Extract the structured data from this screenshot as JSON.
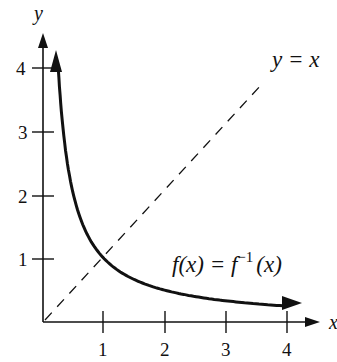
{
  "chart_data": {
    "type": "line",
    "title": "",
    "xlabel": "x",
    "ylabel": "y",
    "xlim": [
      0,
      4.5
    ],
    "ylim": [
      0,
      4.5
    ],
    "grid": false,
    "x_ticks": [
      "1",
      "2",
      "3",
      "4"
    ],
    "y_ticks": [
      "1",
      "2",
      "3",
      "4"
    ],
    "series": [
      {
        "name": "f(x) = f^-1(x)",
        "function": "y = 1/x",
        "style": "solid-thick-arrowheads",
        "x": [
          0.25,
          0.3,
          0.4,
          0.5,
          0.75,
          1,
          1.5,
          2,
          2.5,
          3,
          3.5,
          4
        ],
        "y": [
          4,
          3.33,
          2.5,
          2,
          1.33,
          1,
          0.67,
          0.5,
          0.4,
          0.33,
          0.29,
          0.25
        ]
      },
      {
        "name": "y = x",
        "function": "y = x",
        "style": "dashed",
        "x": [
          0,
          4
        ],
        "y": [
          0,
          4
        ]
      }
    ],
    "annotations": [
      {
        "text": "y = x",
        "x": 3.9,
        "y": 4.2
      },
      {
        "text": "f(x) = f^-1(x)",
        "x": 2.6,
        "y": 0.9
      }
    ]
  },
  "labels": {
    "x_axis": "x",
    "y_axis": "y",
    "x_ticks": [
      "1",
      "2",
      "3",
      "4"
    ],
    "y_ticks": [
      "1",
      "2",
      "3",
      "4"
    ],
    "line_label": "y = x",
    "curve_label_prefix": "f(x) = f",
    "curve_label_sup": "−1",
    "curve_label_suffix": "(x)"
  }
}
